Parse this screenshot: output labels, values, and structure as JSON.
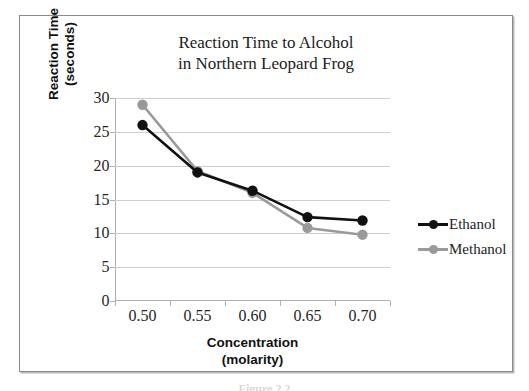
{
  "chart_data": {
    "type": "line",
    "title": "Reaction Time to Alcohol in Northern Leopard Frog",
    "title_lines": [
      "Reaction Time to Alcohol",
      "in Northern Leopard Frog"
    ],
    "xlabel": "Concentration (molarity)",
    "xlabel_lines": [
      "Concentration",
      "(molarity)"
    ],
    "ylabel": "Reaction Time (seconds)",
    "ylabel_lines": [
      "Reaction Time",
      "(seconds)"
    ],
    "categories": [
      "0.50",
      "0.55",
      "0.60",
      "0.65",
      "0.70"
    ],
    "ylim": [
      0,
      30
    ],
    "yticks": [
      0,
      5,
      10,
      15,
      20,
      25,
      30
    ],
    "ytick_labels": [
      "0",
      "5",
      "10",
      "15",
      "20",
      "25",
      "30"
    ],
    "grid": true,
    "grid_axis": "y",
    "legend_position": "right",
    "series": [
      {
        "name": "Ethanol",
        "color": "#111111",
        "values": [
          26,
          19,
          16.3,
          12.4,
          11.9
        ]
      },
      {
        "name": "Methanol",
        "color": "#9a9a9a",
        "values": [
          29,
          19.2,
          16,
          10.8,
          9.8
        ]
      }
    ]
  },
  "legend": {
    "entries": [
      {
        "label": "Ethanol"
      },
      {
        "label": "Methanol"
      }
    ]
  },
  "caption": "Figure 2.2"
}
